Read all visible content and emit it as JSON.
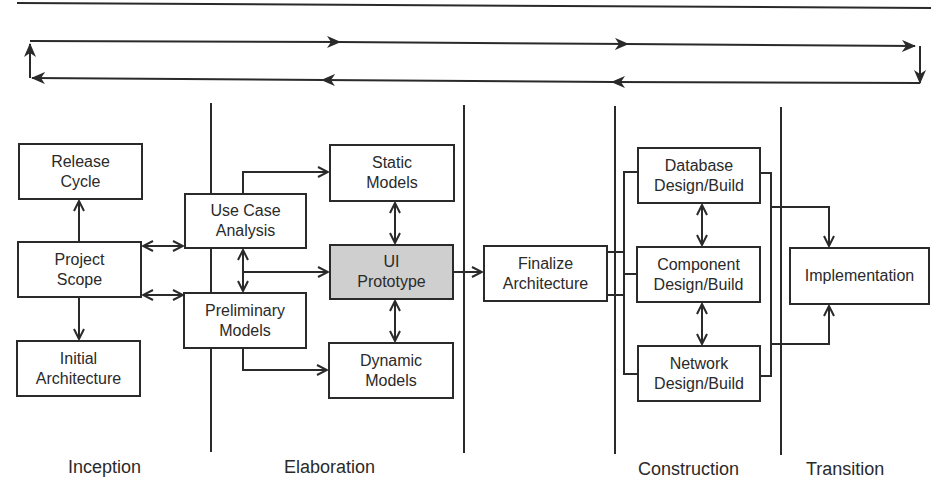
{
  "diagram": {
    "boxes": {
      "release_cycle": "Release\nCycle",
      "project_scope": "Project\nScope",
      "initial_architecture": "Initial\nArchitecture",
      "use_case_analysis": "Use Case\nAnalysis",
      "preliminary_models": "Preliminary\nModels",
      "static_models": "Static\nModels",
      "ui_prototype": "UI\nPrototype",
      "dynamic_models": "Dynamic\nModels",
      "finalize_architecture": "Finalize\nArchitecture",
      "database_design_build": "Database\nDesign/Build",
      "component_design_build": "Component\nDesign/Build",
      "network_design_build": "Network\nDesign/Build",
      "implementation": "Implementation"
    },
    "phases": {
      "inception": "Inception",
      "elaboration": "Elaboration",
      "construction": "Construction",
      "transition": "Transition"
    },
    "colors": {
      "line": "#2a2a2a",
      "highlight_fill": "#cfcfcf",
      "background": "#ffffff"
    }
  }
}
